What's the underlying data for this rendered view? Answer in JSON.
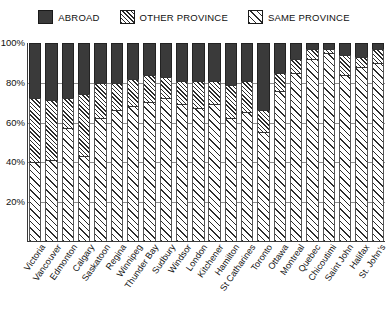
{
  "legend": {
    "items": [
      {
        "label": "ABROAD",
        "key": "abroad",
        "swatch": "solid-dark-swatch"
      },
      {
        "label": "OTHER PROVINCE",
        "key": "other_province",
        "swatch": "dense-hatch-swatch"
      },
      {
        "label": "SAME PROVINCE",
        "key": "same_province",
        "swatch": "light-hatch-swatch"
      }
    ]
  },
  "axis": {
    "y_ticks": [
      "100%",
      "80%",
      "60%",
      "40%",
      "20%"
    ],
    "y_tick_values": [
      100,
      80,
      60,
      40,
      20
    ]
  },
  "chart_data": {
    "type": "bar",
    "title": "",
    "subtitle": "",
    "xlabel": "",
    "ylabel": "",
    "ylim": [
      0,
      100
    ],
    "grid": true,
    "stacked": true,
    "stack_order_bottom_to_top": [
      "SAME PROVINCE",
      "OTHER PROVINCE",
      "ABROAD"
    ],
    "legend_position": "top",
    "categories": [
      "Victoria",
      "Vancouver",
      "Edmonton",
      "Calgary",
      "Saskatoon",
      "Regina",
      "Winnipeg",
      "Thunder Bay",
      "Sudbury",
      "Windsor",
      "London",
      "Kitchener",
      "Hamilton",
      "St Catharines",
      "Toronto",
      "Ottawa",
      "Montreal",
      "Quebec",
      "Chicoutimi",
      "Saint John",
      "Halifax",
      "St. John's"
    ],
    "series": [
      {
        "name": "SAME PROVINCE",
        "values": [
          40,
          41,
          57,
          43,
          62,
          66,
          68,
          70,
          72,
          69,
          67,
          69,
          62,
          65,
          55,
          76,
          85,
          92,
          95,
          84,
          88,
          90
        ]
      },
      {
        "name": "OTHER PROVINCE",
        "values": [
          32,
          30,
          15,
          31,
          18,
          14,
          14,
          14,
          11,
          12,
          14,
          12,
          17,
          16,
          11,
          9,
          7,
          5,
          2,
          10,
          5,
          7
        ]
      },
      {
        "name": "ABROAD",
        "values": [
          28,
          29,
          28,
          26,
          20,
          20,
          18,
          16,
          17,
          19,
          19,
          19,
          21,
          19,
          34,
          15,
          8,
          3,
          3,
          6,
          7,
          3
        ]
      }
    ]
  }
}
